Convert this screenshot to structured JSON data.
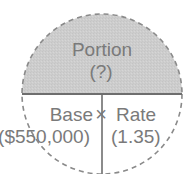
{
  "diagram": {
    "top": {
      "label": "Portion",
      "value": "(?)"
    },
    "bottom_left": {
      "label": "Base",
      "value": "($550,000)"
    },
    "operator": "×",
    "bottom_right": {
      "label": "Rate",
      "value": "(1.35)"
    },
    "colors": {
      "top_fill": "#cdcdcd",
      "bottom_fill": "#ffffff",
      "text": "#7a7a7a",
      "lines": "#6e6e6e",
      "dashed_outline": "#8a8a8a"
    }
  }
}
